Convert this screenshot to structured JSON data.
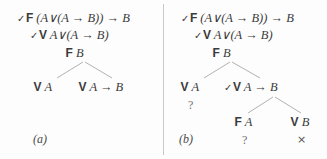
{
  "figure": {
    "type": "semantic-tableau",
    "background": "#fdfdfd",
    "line_color": "#a8a8a8",
    "text_color": "#3b3b3b",
    "panels": [
      {
        "id": "a",
        "caption": "(a)",
        "nodes": [
          {
            "id": "a-root",
            "check": "✓",
            "truth_value": "F",
            "formula": "(A∨(A → B)) → B"
          },
          {
            "id": "a-n2",
            "check": "✓",
            "truth_value": "V",
            "formula": "A∨(A → B)"
          },
          {
            "id": "a-n3",
            "check": "",
            "truth_value": "F",
            "formula": "B"
          },
          {
            "id": "a-leaf-left",
            "check": "",
            "truth_value": "V",
            "formula": "A"
          },
          {
            "id": "a-leaf-right",
            "check": "",
            "truth_value": "V",
            "formula": "A → B"
          }
        ],
        "marks": []
      },
      {
        "id": "b",
        "caption": "(b)",
        "nodes": [
          {
            "id": "b-root",
            "check": "✓",
            "truth_value": "F",
            "formula": "(A∨(A → B)) → B"
          },
          {
            "id": "b-n2",
            "check": "✓",
            "truth_value": "V",
            "formula": "A∨(A → B)"
          },
          {
            "id": "b-n3",
            "check": "",
            "truth_value": "F",
            "formula": "B"
          },
          {
            "id": "b-leaf-left",
            "check": "",
            "truth_value": "V",
            "formula": "A"
          },
          {
            "id": "b-mid-right",
            "check": "✓",
            "truth_value": "V",
            "formula": "A → B"
          },
          {
            "id": "b-leaf-fa",
            "check": "",
            "truth_value": "F",
            "formula": "A"
          },
          {
            "id": "b-leaf-vb",
            "check": "",
            "truth_value": "V",
            "formula": "B"
          }
        ],
        "marks": [
          {
            "id": "b-mark-left",
            "symbol": "?"
          },
          {
            "id": "b-mark-fa",
            "symbol": "?"
          },
          {
            "id": "b-mark-vb",
            "symbol": "×"
          }
        ]
      }
    ]
  }
}
